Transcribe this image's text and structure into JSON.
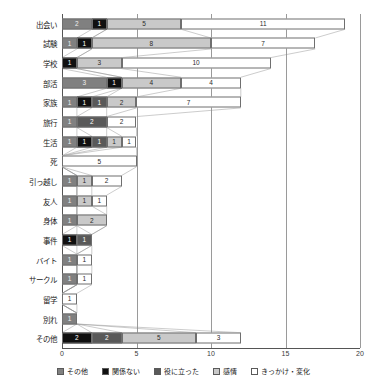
{
  "chart_data": {
    "type": "bar",
    "orientation": "horizontal",
    "stacked": true,
    "title": "",
    "xlabel": "",
    "ylabel": "",
    "xlim": [
      0,
      20
    ],
    "xticks": [
      "0",
      "5",
      "10",
      "15",
      "20"
    ],
    "grid": true,
    "legend_position": "bottom",
    "series": [
      {
        "name": "その他",
        "color": "#808080"
      },
      {
        "name": "関係ない",
        "color": "#101010"
      },
      {
        "name": "役に立った",
        "color": "#595959"
      },
      {
        "name": "感情",
        "color": "#c9c9c9"
      },
      {
        "name": "きっかけ・変化",
        "color": "#ffffff"
      }
    ],
    "categories": [
      "出会い",
      "試験",
      "学校",
      "部活",
      "家族",
      "旅行",
      "生活",
      "死",
      "引っ越し",
      "友人",
      "身体",
      "事件",
      "バイト",
      "サークル",
      "留学",
      "別れ",
      "その他"
    ],
    "rows": [
      {
        "category": "出会い",
        "values": [
          2,
          1,
          0,
          5,
          11
        ],
        "total": 19
      },
      {
        "category": "試験",
        "values": [
          1,
          1,
          0,
          8,
          7
        ],
        "total": 17
      },
      {
        "category": "学校",
        "values": [
          0,
          1,
          0,
          3,
          10
        ],
        "total": 14
      },
      {
        "category": "部活",
        "values": [
          3,
          1,
          0,
          4,
          4
        ],
        "total": 12
      },
      {
        "category": "家族",
        "values": [
          1,
          1,
          1,
          2,
          7
        ],
        "total": 12
      },
      {
        "category": "旅行",
        "values": [
          1,
          0,
          2,
          0,
          2
        ],
        "total": 5
      },
      {
        "category": "生活",
        "values": [
          1,
          1,
          1,
          1,
          1
        ],
        "total": 5
      },
      {
        "category": "死",
        "values": [
          0,
          0,
          0,
          0,
          5
        ],
        "total": 5
      },
      {
        "category": "引っ越し",
        "values": [
          1,
          0,
          0,
          1,
          2
        ],
        "total": 4
      },
      {
        "category": "友人",
        "values": [
          1,
          0,
          0,
          1,
          1
        ],
        "total": 3
      },
      {
        "category": "身体",
        "values": [
          1,
          0,
          0,
          2,
          0
        ],
        "total": 3
      },
      {
        "category": "事件",
        "values": [
          0,
          1,
          1,
          0,
          0
        ],
        "total": 2
      },
      {
        "category": "バイト",
        "values": [
          1,
          0,
          0,
          0,
          1
        ],
        "total": 2
      },
      {
        "category": "サークル",
        "values": [
          1,
          0,
          0,
          0,
          1
        ],
        "total": 2
      },
      {
        "category": "留学",
        "values": [
          0,
          0,
          0,
          0,
          1
        ],
        "total": 1
      },
      {
        "category": "別れ",
        "values": [
          1,
          0,
          0,
          0,
          0
        ],
        "total": 1
      },
      {
        "category": "その他",
        "values": [
          0,
          2,
          2,
          5,
          3
        ],
        "total": 12
      }
    ]
  },
  "legend": {
    "items": [
      {
        "label": "その他",
        "color": "#808080"
      },
      {
        "label": "関係ない",
        "color": "#101010"
      },
      {
        "label": "役に立った",
        "color": "#595959"
      },
      {
        "label": "感情",
        "color": "#c9c9c9"
      },
      {
        "label": "きっかけ・変化",
        "color": "#ffffff"
      }
    ]
  }
}
